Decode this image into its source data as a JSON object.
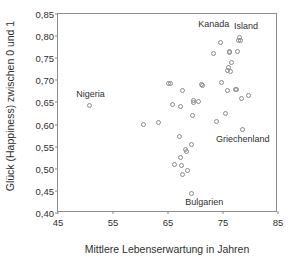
{
  "chart_data": {
    "type": "scatter",
    "title": "",
    "xlabel": "Mittlere Lebenserwartung in Jahren",
    "ylabel": "Glück (Happiness) zwischen 0 und 1",
    "xlim": [
      45,
      85
    ],
    "ylim": [
      0.4,
      0.85
    ],
    "xticks": [
      "45",
      "55",
      "65",
      "75",
      "85"
    ],
    "xtick_values": [
      45,
      55,
      65,
      75,
      85
    ],
    "yticks": [
      "0,40",
      "0,45",
      "0,50",
      "0,55",
      "0,60",
      "0,65",
      "0,70",
      "0,75",
      "0,80",
      "0,85"
    ],
    "ytick_values": [
      0.4,
      0.45,
      0.5,
      0.55,
      0.6,
      0.65,
      0.7,
      0.75,
      0.8,
      0.85
    ],
    "grid": false,
    "legend": false,
    "marker": "open-circle",
    "marker_color": "#8a8a8a",
    "frame_color": "#8c8c8c",
    "points": [
      {
        "x": 50.8,
        "y": 0.643
      },
      {
        "x": 60.6,
        "y": 0.601
      },
      {
        "x": 63.3,
        "y": 0.605
      },
      {
        "x": 65.1,
        "y": 0.692
      },
      {
        "x": 65.4,
        "y": 0.692
      },
      {
        "x": 65.9,
        "y": 0.646
      },
      {
        "x": 67.2,
        "y": 0.641
      },
      {
        "x": 67.6,
        "y": 0.677
      },
      {
        "x": 67.0,
        "y": 0.572
      },
      {
        "x": 66.2,
        "y": 0.509
      },
      {
        "x": 67.3,
        "y": 0.525
      },
      {
        "x": 67.4,
        "y": 0.507
      },
      {
        "x": 67.6,
        "y": 0.488
      },
      {
        "x": 68.2,
        "y": 0.543
      },
      {
        "x": 68.3,
        "y": 0.538
      },
      {
        "x": 68.6,
        "y": 0.495
      },
      {
        "x": 69.2,
        "y": 0.556
      },
      {
        "x": 69.3,
        "y": 0.443
      },
      {
        "x": 69.4,
        "y": 0.62
      },
      {
        "x": 69.6,
        "y": 0.654
      },
      {
        "x": 69.7,
        "y": 0.649
      },
      {
        "x": 70.6,
        "y": 0.652
      },
      {
        "x": 71.0,
        "y": 0.69
      },
      {
        "x": 71.2,
        "y": 0.689
      },
      {
        "x": 73.2,
        "y": 0.76
      },
      {
        "x": 73.8,
        "y": 0.608
      },
      {
        "x": 74.5,
        "y": 0.785
      },
      {
        "x": 74.7,
        "y": 0.696
      },
      {
        "x": 75.4,
        "y": 0.625
      },
      {
        "x": 75.8,
        "y": 0.678
      },
      {
        "x": 75.9,
        "y": 0.722
      },
      {
        "x": 76.0,
        "y": 0.73
      },
      {
        "x": 76.1,
        "y": 0.762
      },
      {
        "x": 76.2,
        "y": 0.765
      },
      {
        "x": 76.4,
        "y": 0.72
      },
      {
        "x": 76.6,
        "y": 0.741
      },
      {
        "x": 77.2,
        "y": 0.68
      },
      {
        "x": 77.5,
        "y": 0.679
      },
      {
        "x": 77.6,
        "y": 0.765
      },
      {
        "x": 77.8,
        "y": 0.79
      },
      {
        "x": 78.0,
        "y": 0.797
      },
      {
        "x": 78.2,
        "y": 0.789
      },
      {
        "x": 78.3,
        "y": 0.659
      },
      {
        "x": 78.5,
        "y": 0.589
      },
      {
        "x": 79.6,
        "y": 0.666
      }
    ],
    "annotations": [
      {
        "label": "Nigeria",
        "x": 50.9,
        "y": 0.668
      },
      {
        "label": "Kanada",
        "x": 73.3,
        "y": 0.827
      },
      {
        "label": "Island",
        "x": 79.2,
        "y": 0.822
      },
      {
        "label": "Griechenland",
        "x": 78.6,
        "y": 0.567
      },
      {
        "label": "Bulgarien",
        "x": 71.6,
        "y": 0.425
      }
    ]
  }
}
